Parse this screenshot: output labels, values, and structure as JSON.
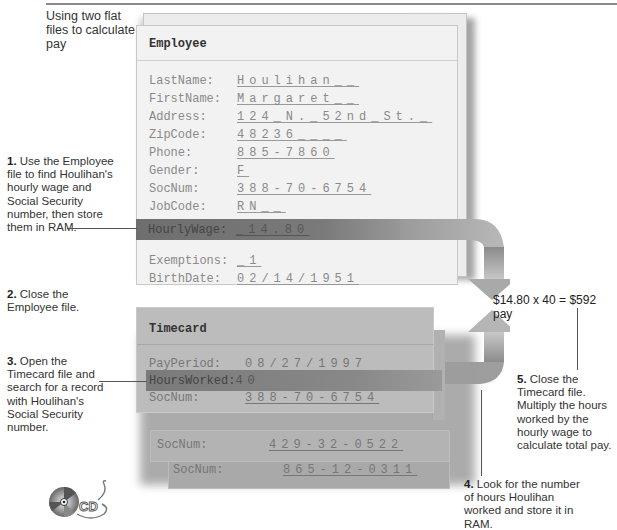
{
  "caption": "Using two flat files to calculate pay",
  "employee_file": {
    "title": "Employee",
    "fields": [
      {
        "label": "LastName:",
        "value": "Houlihan__"
      },
      {
        "label": "FirstName:",
        "value": "Margaret__"
      },
      {
        "label": "Address:",
        "value": "124_N._52nd_St._"
      },
      {
        "label": "ZipCode:",
        "value": "48236____"
      },
      {
        "label": "Phone:",
        "value": "885-7860"
      },
      {
        "label": "Gender:",
        "value": "F"
      },
      {
        "label": "SocNum:",
        "value": "388-70-6754"
      },
      {
        "label": "JobCode:",
        "value": "RN__"
      },
      {
        "label": "DeptCode:",
        "value": "LC"
      },
      {
        "label": "HourlyWage:",
        "value": "_14.80",
        "highlighted": true
      },
      {
        "label": "Exemptions:",
        "value": "_1"
      },
      {
        "label": "BirthDate:",
        "value": "02/14/1951"
      }
    ]
  },
  "timecard_file": {
    "title": "Timecard",
    "fields": [
      {
        "label": "PayPeriod:",
        "value": "08/27/1997"
      },
      {
        "label": "HoursWorked:",
        "value": "40",
        "highlighted": true
      },
      {
        "label": "SocNum:",
        "value": "388-70-6754"
      }
    ],
    "other_records": [
      {
        "label": "SocNum:",
        "value": "429-32-0522"
      },
      {
        "label": "SocNum:",
        "value": "865-12-0311"
      }
    ]
  },
  "steps": [
    {
      "num": "1.",
      "text": "Use the Employee file to find Houlihan's hourly wage and Social Security number, then store them in RAM."
    },
    {
      "num": "2.",
      "text": "Close the Employee file."
    },
    {
      "num": "3.",
      "text": "Open the Timecard file and search for a record with Houlihan's Social Security number."
    },
    {
      "num": "4.",
      "text": "Look for the number of hours Houlihan worked and store it in RAM."
    },
    {
      "num": "5.",
      "text": "Close the Timecard file. Multiply the hours worked by the hourly wage to calculate total pay."
    }
  ],
  "equation": "$14.80 x 40 = $592 pay",
  "logo": {
    "icon": "cd-icon",
    "text": "CD"
  }
}
